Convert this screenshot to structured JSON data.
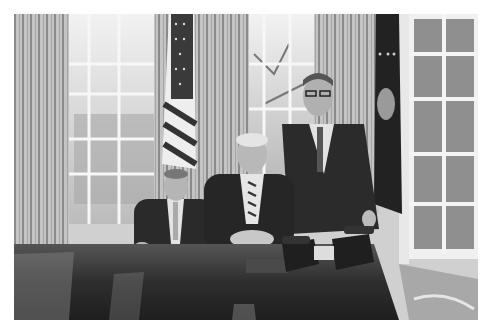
{
  "image": {
    "kind": "black-and-white photograph",
    "scene": "Oval Office, three men in suits posing at the Resolute Desk",
    "elements": [
      {
        "name": "left-curtain",
        "desc": "striped draped curtain at far left"
      },
      {
        "name": "left-window",
        "desc": "multi-pane window with trees outside"
      },
      {
        "name": "american-flag",
        "desc": "US flag on pole between windows"
      },
      {
        "name": "center-curtain",
        "desc": "striped curtain between windows"
      },
      {
        "name": "center-window",
        "desc": "multi-pane window with bare tree branches"
      },
      {
        "name": "presidential-flag",
        "desc": "dark flag with seal and fringe"
      },
      {
        "name": "right-window",
        "desc": "multi-pane window at right"
      },
      {
        "name": "man-left-seated",
        "desc": "seated man in dark suit, light tie"
      },
      {
        "name": "man-center-seated",
        "desc": "seated man in dark suit, striped tie, hands clasped"
      },
      {
        "name": "man-right-standing",
        "desc": "standing man with glasses, dark suit"
      },
      {
        "name": "desk",
        "desc": "polished dark wooden desk with reflections"
      },
      {
        "name": "desk-phones",
        "desc": "two telephones on desk"
      },
      {
        "name": "carpet",
        "desc": "light patterned carpet at lower right"
      }
    ],
    "colors": {
      "background": "#ffffff",
      "curtain": "#bdbdbd",
      "window": "#e6e6e6",
      "suit": "#2a2a2a",
      "desk": "#3a3a3a"
    }
  }
}
